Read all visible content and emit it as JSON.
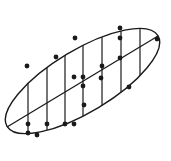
{
  "diagram": {
    "type": "scatter-with-confidence-ellipse",
    "colors": {
      "stroke": "#1a1a1a",
      "background": "#ffffff"
    },
    "ellipse": {
      "cx": 82.5,
      "cy": 81,
      "rx": 88,
      "ry": 31,
      "rotation": -31
    },
    "regression_line": {
      "x1": 7,
      "y1": 127,
      "x2": 158,
      "y2": 36
    },
    "strip_lines_x": [
      28,
      47,
      65,
      83,
      102,
      121,
      140
    ],
    "points": [
      [
        27,
        66
      ],
      [
        56,
        57
      ],
      [
        75,
        38
      ],
      [
        28,
        124
      ],
      [
        28,
        133
      ],
      [
        37,
        135
      ],
      [
        47,
        124
      ],
      [
        65,
        124
      ],
      [
        74,
        124
      ],
      [
        74,
        77
      ],
      [
        83,
        77
      ],
      [
        83,
        86
      ],
      [
        84,
        105
      ],
      [
        102,
        66
      ],
      [
        101,
        78
      ],
      [
        129,
        87
      ],
      [
        120,
        28
      ],
      [
        120,
        38
      ],
      [
        120,
        58
      ],
      [
        157,
        39
      ]
    ]
  }
}
